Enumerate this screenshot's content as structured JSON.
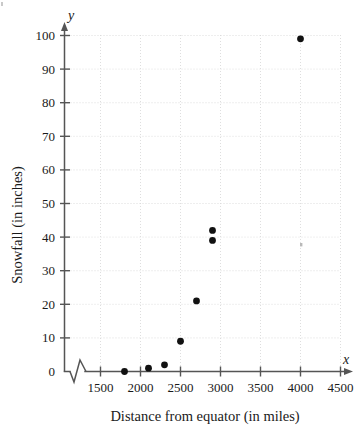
{
  "chart_data": {
    "type": "scatter",
    "title": "",
    "xlabel": "Distance from equator (in miles)",
    "ylabel": "Snowfall (in inches)",
    "x_axis_symbol": "x",
    "y_axis_symbol": "y",
    "xlim": [
      1300,
      4500
    ],
    "ylim": [
      0,
      100
    ],
    "xticks": [
      1500,
      2000,
      2500,
      3000,
      3500,
      4000,
      4500
    ],
    "xtick_labels": [
      "1500",
      "2000",
      "2500",
      "3000",
      "3500",
      "4000",
      "4500"
    ],
    "yticks": [
      0,
      10,
      20,
      30,
      40,
      50,
      60,
      70,
      80,
      90,
      100
    ],
    "ytick_labels": [
      "0",
      "10",
      "20",
      "30",
      "40",
      "50",
      "60",
      "70",
      "80",
      "90",
      "100"
    ],
    "grid": true,
    "legend": "none",
    "axis_break": "x-axis zigzag break between origin and 1500",
    "points": [
      {
        "x": 1800,
        "y": 0
      },
      {
        "x": 2100,
        "y": 1
      },
      {
        "x": 2300,
        "y": 2
      },
      {
        "x": 2500,
        "y": 9
      },
      {
        "x": 2700,
        "y": 21
      },
      {
        "x": 2900,
        "y": 39
      },
      {
        "x": 2900,
        "y": 42
      },
      {
        "x": 4000,
        "y": 99
      }
    ],
    "colors": {
      "marker": "#111111",
      "axis": "#555555",
      "grid": "#d8d8d8",
      "background": "#ffffff"
    }
  }
}
